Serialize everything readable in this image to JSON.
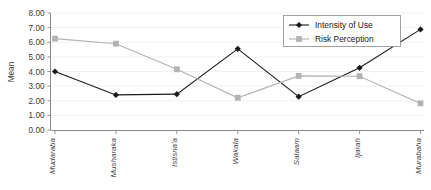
{
  "chart_data": {
    "type": "line",
    "title": "",
    "xlabel": "",
    "ylabel": "Mean",
    "ylim": [
      0,
      8
    ],
    "ytick_step": 1,
    "ytick_labels": [
      "0.00",
      "1.00",
      "2.00",
      "3.00",
      "4.00",
      "5.00",
      "6.00",
      "7.00",
      "8.00"
    ],
    "grid": true,
    "legend_position": "top-right",
    "categories": [
      "Mudaraba",
      "Musharaka",
      "Istisna'a",
      "Wakala",
      "Salaam",
      "Ijarah",
      "Murabaha"
    ],
    "series": [
      {
        "name": "Intensity of Use",
        "values": [
          4.0,
          2.4,
          2.45,
          5.55,
          2.28,
          4.25,
          6.88
        ],
        "color": "#1a1a1a",
        "marker": "diamond"
      },
      {
        "name": "Risk Perception",
        "values": [
          6.25,
          5.9,
          4.15,
          2.2,
          3.7,
          3.68,
          1.82
        ],
        "color": "#b3b3b3",
        "marker": "square"
      }
    ]
  },
  "legend": {
    "entries": [
      {
        "label": "Intensity of Use"
      },
      {
        "label": "Risk Perception"
      }
    ]
  },
  "axes": {
    "y_title": "Mean"
  },
  "colors": {
    "series_1": "#1a1a1a",
    "series_2": "#b3b3b3",
    "grid": "#ededed",
    "axis": "#8a8a8a",
    "text": "#3a3a3a"
  }
}
